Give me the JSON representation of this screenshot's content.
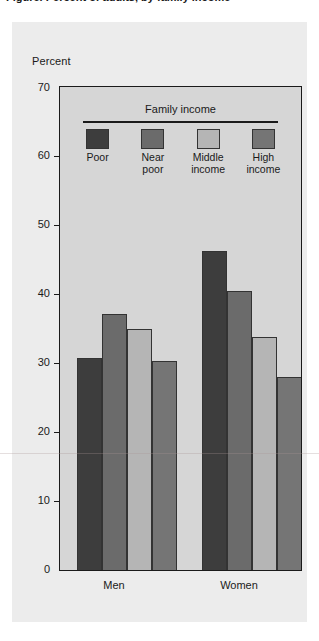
{
  "figure": {
    "clipped_title": "Figure. Percent of adults, by family income",
    "y_axis_title": "Percent"
  },
  "legend": {
    "title": "Family income",
    "items": [
      {
        "label": "Poor",
        "color": "#3d3d3d"
      },
      {
        "label": "Near\npoor",
        "color": "#6b6b6b"
      },
      {
        "label": "Middle\nincome",
        "color": "#b5b5b5"
      },
      {
        "label": "High\nincome",
        "color": "#757575"
      }
    ]
  },
  "axis": {
    "ticks": [
      "70",
      "60",
      "50",
      "40",
      "30",
      "20",
      "10",
      "0"
    ]
  },
  "groups": [
    {
      "label": "Men"
    },
    {
      "label": "Women"
    }
  ],
  "chart_data": {
    "type": "bar",
    "title": "Percent of adults, by family income",
    "xlabel": "",
    "ylabel": "Percent",
    "ylim": [
      0,
      70
    ],
    "ytick_step": 10,
    "grid": false,
    "legend_title": "Family income",
    "legend_position": "inside-top",
    "categories": [
      "Men",
      "Women"
    ],
    "series": [
      {
        "name": "Poor",
        "color": "#3d3d3d",
        "values": [
          30.8,
          46.3
        ]
      },
      {
        "name": "Near poor",
        "color": "#6b6b6b",
        "values": [
          37.2,
          40.5
        ]
      },
      {
        "name": "Middle income",
        "color": "#b5b5b5",
        "values": [
          35.0,
          33.8
        ]
      },
      {
        "name": "High income",
        "color": "#757575",
        "values": [
          30.4,
          28.1
        ]
      }
    ]
  }
}
